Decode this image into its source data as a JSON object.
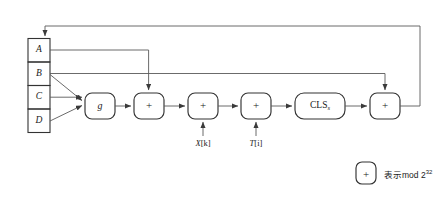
{
  "diagram": {
    "registers": [
      {
        "id": "A",
        "label": "A"
      },
      {
        "id": "B",
        "label": "B"
      },
      {
        "id": "C",
        "label": "C"
      },
      {
        "id": "D",
        "label": "D"
      }
    ],
    "nodes": {
      "g": "g",
      "add1": "+",
      "add2": "+",
      "add3": "+",
      "cls": "CLS",
      "cls_sub": "s",
      "add4": "+"
    },
    "inputs": {
      "x": "X[k]",
      "x_name": "X",
      "x_index": "[k]",
      "t": "T[i]",
      "t_name": "T",
      "t_index": "[i]"
    },
    "legend": {
      "symbol": "+",
      "text_cn": "表示",
      "text_mod": "mod 2",
      "exponent": "32",
      "full": "表示mod 2^32"
    },
    "colors": {
      "stroke": "#4d4d4d",
      "box_stroke": "#333333",
      "text": "#1a1a1a",
      "background": "#ffffff"
    }
  }
}
